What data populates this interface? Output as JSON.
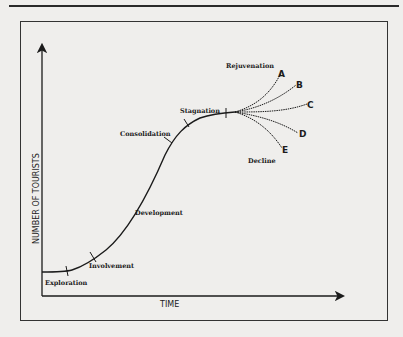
{
  "diagram": {
    "axes": {
      "x_label": "TIME",
      "y_label": "NUMBER OF TOURISTS"
    },
    "stages": [
      {
        "name": "Exploration"
      },
      {
        "name": "Involvement"
      },
      {
        "name": "Development"
      },
      {
        "name": "Consolidation"
      },
      {
        "name": "Stagnation"
      },
      {
        "name": "Rejuvenation"
      },
      {
        "name": "Decline"
      }
    ],
    "scenarios": [
      "A",
      "B",
      "C",
      "D",
      "E"
    ],
    "colors": {
      "background": "#efeeec",
      "ink": "#1b1b1b"
    }
  }
}
